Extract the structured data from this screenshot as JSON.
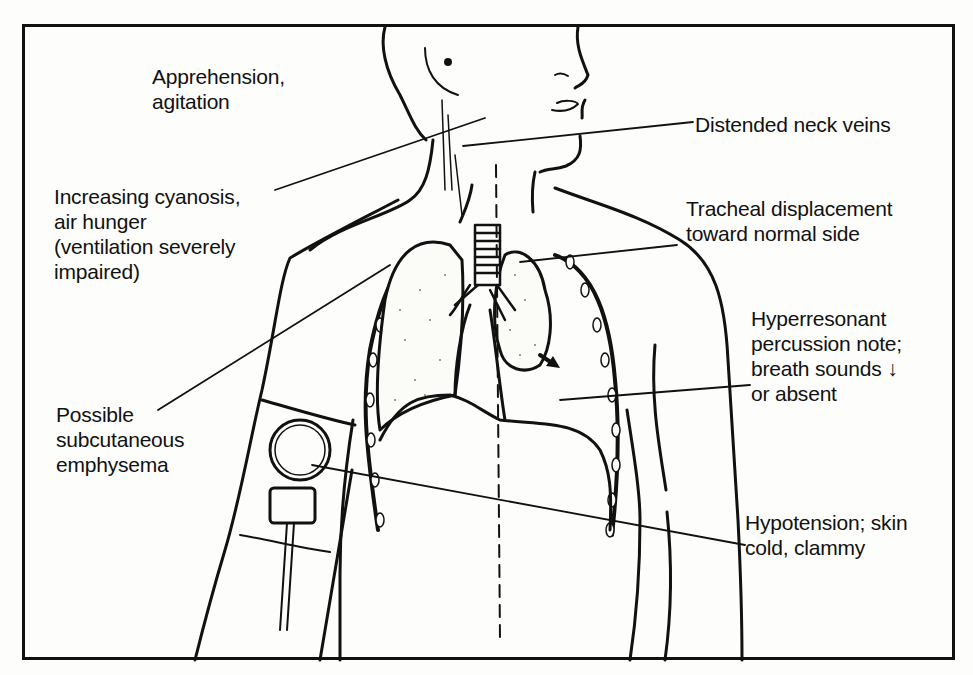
{
  "figure": {
    "labels": {
      "apprehension": "Apprehension,\nagitation",
      "cyanosis": "Increasing cyanosis,\nair hunger\n(ventilation severely\nimpaired)",
      "emphysema": "Possible\nsubcutaneous\nemphysema",
      "neck_veins": "Distended neck veins",
      "tracheal": "Tracheal displacement\ntoward normal side",
      "hyperresonant": "Hyperresonant\npercussion note;\nbreath sounds ↓\n or absent",
      "hypotension": "Hypotension; skin\ncold, clammy"
    },
    "colors": {
      "ink": "#111111",
      "paper": "#fdfdfb"
    }
  }
}
